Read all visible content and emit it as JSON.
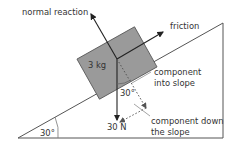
{
  "diagram": {
    "type": "inclined-plane-force-diagram",
    "slope": {
      "angle_label": "30°",
      "angle_deg": 30
    },
    "block": {
      "mass_label": "3 kg",
      "color": "#9a9a9a"
    },
    "forces": {
      "normal": {
        "label": "normal reaction"
      },
      "friction": {
        "label": "friction"
      },
      "weight": {
        "label": "30 N"
      },
      "component_into": {
        "label_line1": "component",
        "label_line2": "into slope"
      },
      "component_down": {
        "label_line1": "component down",
        "label_line2": "the slope"
      },
      "weight_angle_label": "30°"
    }
  }
}
